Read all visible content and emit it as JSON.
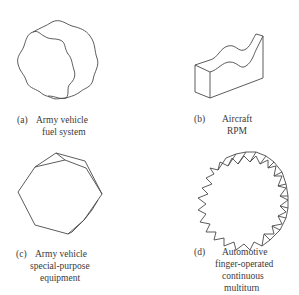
{
  "figure": {
    "panels": [
      {
        "id": "a",
        "tag": "(a)",
        "shape": "scalloped-round-knob",
        "lines": [
          "Army vehicle",
          "fuel system"
        ]
      },
      {
        "id": "b",
        "tag": "(b)",
        "shape": "wavy-top-bar-knob",
        "lines": [
          "Aircraft",
          "RPM"
        ]
      },
      {
        "id": "c",
        "tag": "(c)",
        "shape": "hexagonal-knob",
        "lines": [
          "Army vehicle",
          "special-purpose",
          "equipment"
        ]
      },
      {
        "id": "d",
        "tag": "(d)",
        "shape": "serrated-round-knob",
        "lines": [
          "Automotive",
          "finger-operated",
          "continuous",
          "multiturn"
        ]
      }
    ],
    "stroke_color": "#4a4a4a",
    "background": "#ffffff"
  }
}
